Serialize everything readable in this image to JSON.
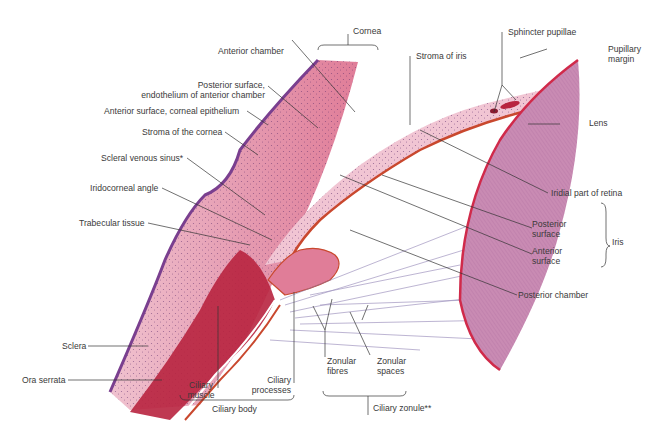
{
  "figure": {
    "colors": {
      "cornea_stroma": "#e8a7b8",
      "epithelium": "#7a3f8f",
      "ciliary_muscle": "#b8243f",
      "iris_border": "#c9482e",
      "lens_fill": "#c98bb3",
      "lens_capsule": "#d02a4a",
      "zonule_fibres": "#8a7bb0",
      "leader_line": "#333333",
      "label_text": "#3a3a3a"
    }
  },
  "labels": {
    "cornea": "Cornea",
    "anterior_chamber": "Anterior chamber",
    "posterior_surface_l1": "Posterior surface,",
    "posterior_surface_l2": "endothelium of anterior chamber",
    "anterior_surface_epithelium": "Anterior surface, corneal epithelium",
    "stroma_cornea": "Stroma of the cornea",
    "scleral_venous_sinus": "Scleral venous sinus*",
    "iridocorneal_angle": "Iridocorneal angle",
    "trabecular_tissue": "Trabecular tissue",
    "sclera": "Sclera",
    "ora_serrata": "Ora serrata",
    "ciliary_muscle_l1": "Ciliary",
    "ciliary_muscle_l2": "muscle",
    "ciliary_processes_l1": "Ciliary",
    "ciliary_processes_l2": "processes",
    "ciliary_body": "Ciliary body",
    "zonular_fibres_l1": "Zonular",
    "zonular_fibres_l2": "fibres",
    "zonular_spaces_l1": "Zonular",
    "zonular_spaces_l2": "spaces",
    "ciliary_zonule": "Ciliary zonule**",
    "stroma_iris": "Stroma of iris",
    "sphincter_pupillae": "Sphincter pupillae",
    "pupillary_margin_l1": "Pupillary",
    "pupillary_margin_l2": "margin",
    "lens": "Lens",
    "iridial_part_retina": "Iridial part of retina",
    "iris_posterior_l1": "Posterior",
    "iris_posterior_l2": "surface",
    "iris_anterior_l1": "Anterior",
    "iris_anterior_l2": "surface",
    "iris": "Iris",
    "posterior_chamber": "Posterior chamber"
  }
}
